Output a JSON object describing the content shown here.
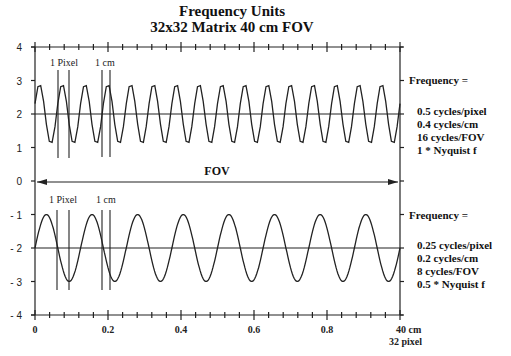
{
  "title": {
    "line1": "Frequency  Units",
    "line2": "32x32 Matrix   40 cm FOV"
  },
  "y_axis": {
    "ticks": [
      "4",
      "3",
      "2",
      "1",
      "0",
      "- 1",
      "- 2",
      "- 3",
      "- 4"
    ]
  },
  "x_axis": {
    "ticks": [
      "0",
      "0.2",
      "0.4",
      "0.6",
      "0.8"
    ],
    "end_label_top": "40 cm",
    "end_label_bottom": "32 pixel"
  },
  "fov_label": "FOV",
  "top_panel": {
    "marker_pixel_label": "1 Pixel",
    "marker_cm_label": "1 cm",
    "frequency_heading": "Frequency =",
    "lines": [
      "0.5 cycles/pixel",
      "0.4 cycles/cm",
      "16 cycles/FOV",
      "1 * Nyquist f"
    ]
  },
  "bottom_panel": {
    "marker_pixel_label": "1 Pixel",
    "marker_cm_label": "1 cm",
    "frequency_heading": "Frequency =",
    "lines": [
      "0.25 cycles/pixel",
      "0.2 cycles/cm",
      "8 cycles/FOV",
      "0.5 * Nyquist f"
    ]
  },
  "chart_data": {
    "type": "line",
    "xlabel": "Position across FOV (fraction; 40 cm = 32 pixel)",
    "ylabel": "",
    "xlim": [
      0,
      1
    ],
    "ylim": [
      -4,
      4
    ],
    "series": [
      {
        "name": "Nyquist (0.5 cycles/pixel, 16 cycles/FOV)",
        "center": 2,
        "amplitude": 0.9,
        "cycles_per_fov": 16,
        "samples_per_fov": 64
      },
      {
        "name": "Half Nyquist (0.25 cycles/pixel, 8 cycles/FOV)",
        "center": -2,
        "amplitude": 1.0,
        "cycles_per_fov": 8
      }
    ],
    "annotations": [
      "1 Pixel",
      "1 cm",
      "FOV"
    ]
  }
}
